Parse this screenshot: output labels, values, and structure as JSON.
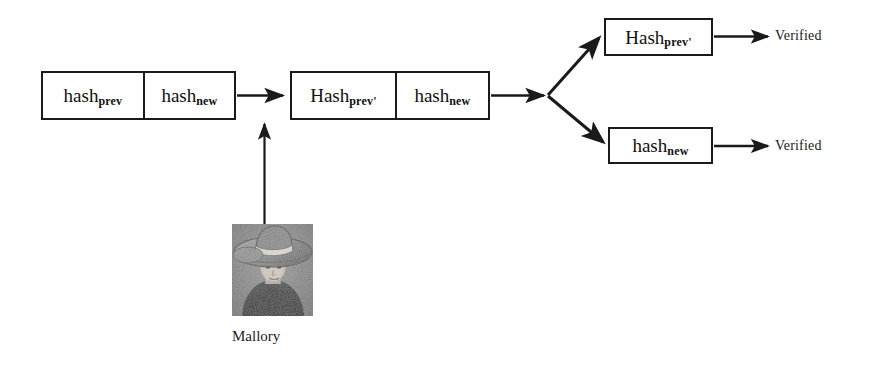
{
  "diagram": {
    "type": "hash-chain-forgery-attack",
    "nodes": {
      "chain_original": {
        "name": "original-chain-block",
        "cells": [
          {
            "text": "hash",
            "sub": "prev"
          },
          {
            "text": "hash",
            "sub": "new"
          }
        ]
      },
      "chain_forged": {
        "name": "forged-chain-block",
        "cells": [
          {
            "text": "Hash",
            "sub": "prev'"
          },
          {
            "text": "hash",
            "sub": "new"
          }
        ]
      },
      "verify_hash_prev": {
        "name": "verify-hash-prev-block",
        "cells": [
          {
            "text": "Hash",
            "sub": "prev'"
          }
        ]
      },
      "verify_hash_new": {
        "name": "verify-hash-new-block",
        "cells": [
          {
            "text": "hash",
            "sub": "new"
          }
        ]
      }
    },
    "labels": {
      "verified_top": "Verified",
      "verified_bottom": "Verified",
      "mallory": "Mallory"
    },
    "colors": {
      "stroke": "#1a1a1a",
      "text": "#111111",
      "background": "#ffffff",
      "photo_base": "#8c8c8c"
    }
  }
}
